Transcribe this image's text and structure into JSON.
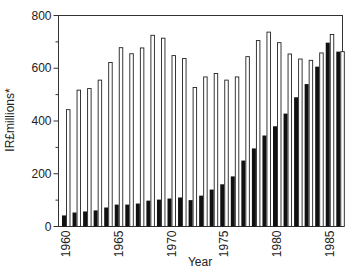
{
  "chart_data": {
    "type": "bar",
    "title": "",
    "xlabel": "Year",
    "ylabel": "IR£millions*",
    "ylim": [
      0,
      800
    ],
    "yticks": [
      0,
      200,
      400,
      600,
      800
    ],
    "yminor_ticks": [
      100,
      300,
      500,
      700
    ],
    "xtick_labels": [
      "1960",
      "1965",
      "1970",
      "1975",
      "1980",
      "1985"
    ],
    "grid": false,
    "legend": null,
    "categories": [
      "1960",
      "1961",
      "1962",
      "1963",
      "1964",
      "1965",
      "1966",
      "1967",
      "1968",
      "1969",
      "1970",
      "1971",
      "1972",
      "1973",
      "1974",
      "1975",
      "1976",
      "1977",
      "1978",
      "1979",
      "1980",
      "1981",
      "1982",
      "1983",
      "1984",
      "1985",
      "1986"
    ],
    "series": [
      {
        "name": "black bars",
        "color": "#111111",
        "fill": "solid",
        "values": [
          42,
          53,
          57,
          61,
          72,
          83,
          83,
          87,
          98,
          102,
          106,
          110,
          100,
          117,
          140,
          160,
          190,
          250,
          296,
          345,
          380,
          428,
          490,
          540,
          606,
          697,
          663
        ]
      },
      {
        "name": "white bars",
        "color": "#ffffff",
        "fill": "outline",
        "values": [
          443,
          517,
          523,
          555,
          622,
          678,
          655,
          677,
          725,
          714,
          648,
          637,
          527,
          567,
          580,
          555,
          567,
          644,
          705,
          737,
          697,
          654,
          635,
          630,
          658,
          728,
          663
        ]
      }
    ]
  }
}
